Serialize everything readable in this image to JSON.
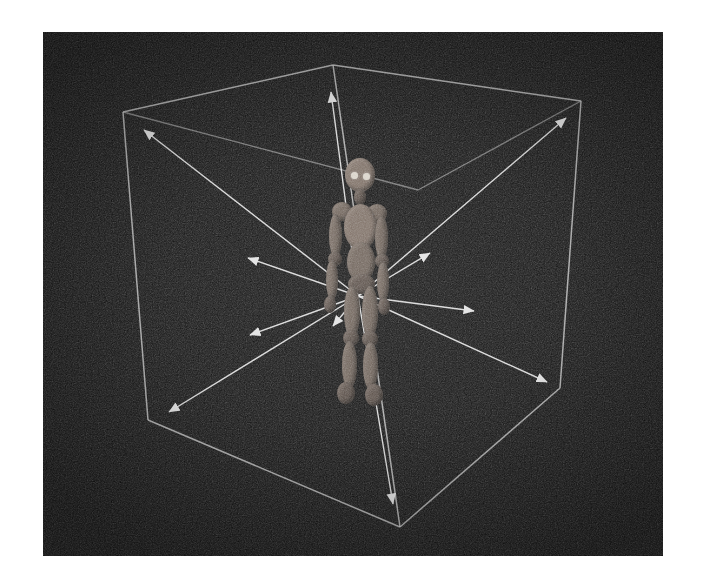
{
  "view": {
    "title": "3D bounding box with radial direction arrows",
    "page_background_color": "#ffffff",
    "viewport_background_color": "#141414",
    "viewport_rect": {
      "x": 43,
      "y": 32,
      "width": 620,
      "height": 524
    },
    "render_noise": "film-grain",
    "line_color": "#c9c9c9",
    "arrow_color": "#e8e8e8",
    "arrow_head_color": "#f2f2f2",
    "figure_color": "#6e6259"
  },
  "scene": {
    "object_label": "humanoid-mannequin",
    "wireframe_label": "bounding-cube",
    "arrow_origin": {
      "x": 358,
      "y": 296
    },
    "cube_vertices": [
      {
        "name": "top-front",
        "x": 333,
        "y": 65
      },
      {
        "name": "top-back-left",
        "x": 123,
        "y": 112
      },
      {
        "name": "top-back-right",
        "x": 581,
        "y": 101
      },
      {
        "name": "top-back-center",
        "x": 418,
        "y": 190
      },
      {
        "name": "bottom-front",
        "x": 400,
        "y": 527
      },
      {
        "name": "bottom-back-left",
        "x": 148,
        "y": 420
      },
      {
        "name": "bottom-back-right",
        "x": 560,
        "y": 388
      },
      {
        "name": "bottom-back-center",
        "x": 418,
        "y": 190
      }
    ],
    "cube_edges": [
      {
        "from": "top-front",
        "to": "top-back-left"
      },
      {
        "from": "top-front",
        "to": "top-back-right"
      },
      {
        "from": "top-back-left",
        "to": "top-back-center"
      },
      {
        "from": "top-back-right",
        "to": "top-back-center"
      },
      {
        "from": "top-back-left",
        "to": "bottom-back-left"
      },
      {
        "from": "top-back-right",
        "to": "bottom-back-right"
      },
      {
        "from": "top-front",
        "to": "bottom-front"
      },
      {
        "from": "bottom-front",
        "to": "bottom-back-left"
      },
      {
        "from": "bottom-front",
        "to": "bottom-back-right"
      }
    ],
    "arrows": [
      {
        "name": "arrow-up",
        "tip_x": 331,
        "tip_y": 92,
        "target_vertex": "top-front"
      },
      {
        "name": "arrow-up-back-left",
        "tip_x": 144,
        "tip_y": 130,
        "target_vertex": "top-back-left"
      },
      {
        "name": "arrow-up-back-right",
        "tip_x": 566,
        "tip_y": 118,
        "target_vertex": "top-back-right"
      },
      {
        "name": "arrow-left",
        "tip_x": 248,
        "tip_y": 258,
        "target_vertex": "mid-back-left"
      },
      {
        "name": "arrow-right",
        "tip_x": 430,
        "tip_y": 253,
        "target_vertex": "mid-back-right"
      },
      {
        "name": "arrow-down-left",
        "tip_x": 250,
        "tip_y": 335,
        "target_vertex": "mid-front-left"
      },
      {
        "name": "arrow-down-right",
        "tip_x": 474,
        "tip_y": 311,
        "target_vertex": "mid-front-right"
      },
      {
        "name": "arrow-front-short",
        "tip_x": 333,
        "tip_y": 326,
        "target_vertex": "front-near"
      },
      {
        "name": "arrow-down-back-left",
        "tip_x": 169,
        "tip_y": 412,
        "target_vertex": "bottom-back-left"
      },
      {
        "name": "arrow-down-back-right",
        "tip_x": 547,
        "tip_y": 382,
        "target_vertex": "bottom-back-right"
      },
      {
        "name": "arrow-down",
        "tip_x": 393,
        "tip_y": 504,
        "target_vertex": "bottom-front"
      }
    ]
  },
  "figure": {
    "name": "humanoid-mannequin",
    "origin": {
      "x": 299,
      "y": 158
    },
    "size": {
      "width": 120,
      "height": 250
    },
    "parts": [
      {
        "name": "head",
        "x": 46,
        "y": 0,
        "w": 30,
        "h": 34,
        "shade": "light"
      },
      {
        "name": "eye-left",
        "x": 52,
        "y": 14,
        "w": 7,
        "h": 7,
        "shade": "eye"
      },
      {
        "name": "eye-right",
        "x": 64,
        "y": 15,
        "w": 7,
        "h": 7,
        "shade": "eye"
      },
      {
        "name": "neck",
        "x": 55,
        "y": 31,
        "w": 12,
        "h": 16,
        "shade": "dark"
      },
      {
        "name": "shoulder-left",
        "x": 33,
        "y": 44,
        "w": 20,
        "h": 19,
        "shade": "limb"
      },
      {
        "name": "shoulder-right",
        "x": 68,
        "y": 46,
        "w": 20,
        "h": 19,
        "shade": "limb"
      },
      {
        "name": "torso-upper",
        "x": 45,
        "y": 46,
        "w": 33,
        "h": 46,
        "shade": "light"
      },
      {
        "name": "torso-lower",
        "x": 48,
        "y": 84,
        "w": 28,
        "h": 40,
        "shade": "limb"
      },
      {
        "name": "upper-arm-left",
        "x": 30,
        "y": 56,
        "w": 13,
        "h": 44,
        "shade": "limb"
      },
      {
        "name": "upper-arm-right",
        "x": 76,
        "y": 58,
        "w": 13,
        "h": 44,
        "shade": "limb"
      },
      {
        "name": "elbow-left",
        "x": 29,
        "y": 94,
        "w": 14,
        "h": 14,
        "shade": "dark"
      },
      {
        "name": "elbow-right",
        "x": 76,
        "y": 96,
        "w": 14,
        "h": 14,
        "shade": "dark"
      },
      {
        "name": "forearm-left",
        "x": 27,
        "y": 102,
        "w": 12,
        "h": 40,
        "shade": "limb"
      },
      {
        "name": "forearm-right",
        "x": 78,
        "y": 104,
        "w": 12,
        "h": 40,
        "shade": "limb"
      },
      {
        "name": "hand-left",
        "x": 25,
        "y": 138,
        "w": 12,
        "h": 17,
        "shade": "dark"
      },
      {
        "name": "hand-right",
        "x": 79,
        "y": 140,
        "w": 12,
        "h": 17,
        "shade": "dark"
      },
      {
        "name": "hip",
        "x": 49,
        "y": 116,
        "w": 27,
        "h": 20,
        "shade": "dark"
      },
      {
        "name": "thigh-left",
        "x": 45,
        "y": 128,
        "w": 16,
        "h": 52,
        "shade": "limb"
      },
      {
        "name": "thigh-right",
        "x": 63,
        "y": 128,
        "w": 16,
        "h": 52,
        "shade": "limb"
      },
      {
        "name": "knee-left",
        "x": 44,
        "y": 172,
        "w": 16,
        "h": 16,
        "shade": "dark"
      },
      {
        "name": "knee-right",
        "x": 63,
        "y": 173,
        "w": 16,
        "h": 16,
        "shade": "dark"
      },
      {
        "name": "shin-left",
        "x": 43,
        "y": 183,
        "w": 15,
        "h": 48,
        "shade": "limb"
      },
      {
        "name": "shin-right",
        "x": 64,
        "y": 184,
        "w": 15,
        "h": 48,
        "shade": "limb"
      },
      {
        "name": "foot-left",
        "x": 38,
        "y": 224,
        "w": 18,
        "h": 22,
        "shade": "dark"
      },
      {
        "name": "foot-right",
        "x": 66,
        "y": 226,
        "w": 18,
        "h": 22,
        "shade": "dark"
      }
    ]
  }
}
